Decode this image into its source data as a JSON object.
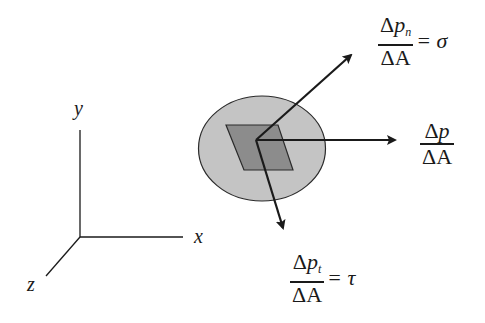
{
  "diagram": {
    "axes": {
      "x_label": "x",
      "y_label": "y",
      "z_label": "z"
    },
    "vectors": {
      "resultant": {
        "numerator_delta": "Δ",
        "numerator_var": "p",
        "numerator_sub": "",
        "denominator": "ΔA",
        "equals": ""
      },
      "normal": {
        "numerator_delta": "Δ",
        "numerator_var": "p",
        "numerator_sub": "n",
        "denominator": "ΔA",
        "equals": "= σ"
      },
      "tangential": {
        "numerator_delta": "Δ",
        "numerator_var": "p",
        "numerator_sub": "t",
        "denominator": "ΔA",
        "equals": "= τ"
      }
    },
    "colors": {
      "body_fill": "#c4c4c4",
      "area_element_fill": "#8c8c8c",
      "stroke": "#1a1a1a",
      "background": "#ffffff"
    }
  }
}
